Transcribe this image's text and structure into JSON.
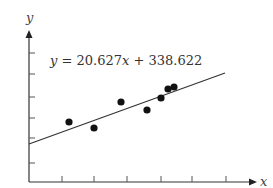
{
  "chart_data": {
    "type": "scatter",
    "title": "",
    "xlabel": "x",
    "ylabel": "y",
    "annotation": "y = 20.627x + 338.622",
    "regression": {
      "slope": 20.627,
      "intercept": 338.622
    },
    "grid": false,
    "x_ticks_count": 6,
    "y_ticks_count": 6,
    "tick_labels_visible": false,
    "points_pixel": [
      [
        69,
        122
      ],
      [
        94,
        128
      ],
      [
        121,
        102
      ],
      [
        147,
        110
      ],
      [
        161,
        98
      ],
      [
        168,
        89
      ],
      [
        174,
        87
      ]
    ],
    "line_pixel": [
      [
        29,
        144
      ],
      [
        225,
        73
      ]
    ],
    "axes_pixel": {
      "origin": [
        29,
        182
      ],
      "x_end": [
        256,
        182
      ],
      "y_end": [
        29,
        30
      ],
      "x_ticks": [
        62,
        94,
        127,
        161,
        192,
        226
      ],
      "y_ticks": [
        163,
        138,
        118,
        97,
        74,
        53
      ]
    }
  },
  "labels": {
    "equation_prefix": "y",
    "equation_rest": " = 20.627",
    "equation_x": "x",
    "equation_tail": " + 338.622",
    "x_axis": "x",
    "y_axis": "y"
  },
  "colors": {
    "ink": "#222222",
    "background": "#ffffff"
  }
}
